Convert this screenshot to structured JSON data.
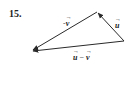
{
  "problem": {
    "number": "15."
  },
  "diagram": {
    "vectors": [
      {
        "name": "u",
        "label": "u",
        "sign": "",
        "from": "right",
        "to": "top"
      },
      {
        "name": "-v",
        "label": "v",
        "sign": "-",
        "from": "top",
        "to": "left"
      },
      {
        "name": "u-v",
        "from": "right",
        "to": "left"
      }
    ],
    "difference_label": {
      "left": "u",
      "operator": "−",
      "right": "v"
    },
    "stroke_color": "#2a2a2a"
  }
}
